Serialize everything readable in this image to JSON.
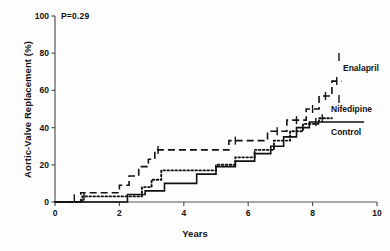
{
  "figure": {
    "annotation": "P=0.29",
    "xlabel": "Years",
    "ylabel": "Aortic-Valve Replacement (%)"
  },
  "axis": {
    "y_ticks": [
      "0",
      "20",
      "40",
      "60",
      "80",
      "100"
    ],
    "x_ticks": [
      "0",
      "2",
      "4",
      "6",
      "8",
      "10"
    ]
  },
  "legend": {
    "enalapril": "Enalapril",
    "nifedipine": "Nifedipine",
    "control": "Control"
  },
  "chart_data": {
    "type": "line",
    "subtype": "kaplan-meier-step",
    "title": "",
    "xlabel": "Years",
    "ylabel": "Aortic-Valve Replacement (%)",
    "xlim": [
      0,
      10
    ],
    "ylim": [
      0,
      100
    ],
    "xticks": [
      0,
      2,
      4,
      6,
      8,
      10
    ],
    "yticks": [
      0,
      20,
      40,
      60,
      80,
      100
    ],
    "grid": false,
    "legend_position": "right-inline",
    "annotations": [
      {
        "text": "P=0.29",
        "x": 0.25,
        "y": 96
      }
    ],
    "series": [
      {
        "name": "Enalapril",
        "style": "dashed",
        "color": "#111111",
        "final_value": 65,
        "points": [
          [
            0.0,
            0
          ],
          [
            0.8,
            0
          ],
          [
            0.8,
            5
          ],
          [
            2.0,
            5
          ],
          [
            2.0,
            9
          ],
          [
            2.3,
            9
          ],
          [
            2.3,
            14
          ],
          [
            2.6,
            14
          ],
          [
            2.6,
            19
          ],
          [
            2.9,
            19
          ],
          [
            2.9,
            23
          ],
          [
            3.1,
            23
          ],
          [
            3.1,
            28
          ],
          [
            5.4,
            28
          ],
          [
            5.4,
            33
          ],
          [
            6.6,
            33
          ],
          [
            6.6,
            38
          ],
          [
            7.2,
            38
          ],
          [
            7.2,
            44
          ],
          [
            7.8,
            44
          ],
          [
            7.8,
            50
          ],
          [
            8.2,
            50
          ],
          [
            8.2,
            57
          ],
          [
            8.6,
            57
          ],
          [
            8.6,
            65
          ],
          [
            8.9,
            65
          ]
        ],
        "censor_marks": [
          [
            0.6,
            2
          ],
          [
            3.2,
            28
          ],
          [
            5.6,
            33
          ],
          [
            6.9,
            38
          ],
          [
            7.5,
            44
          ],
          [
            8.0,
            50
          ],
          [
            8.4,
            57
          ],
          [
            8.75,
            65
          ]
        ]
      },
      {
        "name": "Nifedipine",
        "style": "dotted",
        "color": "#111111",
        "final_value": 45,
        "points": [
          [
            0.0,
            0
          ],
          [
            0.85,
            0
          ],
          [
            0.85,
            3
          ],
          [
            2.7,
            3
          ],
          [
            2.7,
            8
          ],
          [
            3.0,
            8
          ],
          [
            3.0,
            12
          ],
          [
            3.3,
            12
          ],
          [
            3.3,
            17
          ],
          [
            5.0,
            17
          ],
          [
            5.0,
            20
          ],
          [
            5.6,
            20
          ],
          [
            5.6,
            24
          ],
          [
            6.2,
            24
          ],
          [
            6.2,
            28
          ],
          [
            6.8,
            28
          ],
          [
            6.8,
            33
          ],
          [
            7.3,
            33
          ],
          [
            7.3,
            38
          ],
          [
            7.7,
            38
          ],
          [
            7.7,
            42
          ],
          [
            8.2,
            42
          ],
          [
            8.2,
            45
          ],
          [
            8.6,
            45
          ]
        ],
        "censor_marks": [
          [
            0.9,
            3
          ],
          [
            8.3,
            45
          ]
        ]
      },
      {
        "name": "Control",
        "style": "solid",
        "color": "#111111",
        "final_value": 43,
        "points": [
          [
            0.0,
            0
          ],
          [
            2.25,
            0
          ],
          [
            2.25,
            4
          ],
          [
            2.8,
            4
          ],
          [
            2.8,
            6
          ],
          [
            3.4,
            6
          ],
          [
            3.4,
            10
          ],
          [
            4.4,
            10
          ],
          [
            4.4,
            15
          ],
          [
            5.0,
            15
          ],
          [
            5.0,
            19
          ],
          [
            5.6,
            19
          ],
          [
            5.6,
            22
          ],
          [
            6.2,
            22
          ],
          [
            6.2,
            26
          ],
          [
            6.7,
            26
          ],
          [
            6.7,
            30
          ],
          [
            7.1,
            30
          ],
          [
            7.1,
            35
          ],
          [
            7.5,
            35
          ],
          [
            7.5,
            40
          ],
          [
            7.9,
            40
          ],
          [
            7.9,
            43
          ],
          [
            9.6,
            43
          ]
        ],
        "censor_marks": [
          [
            8.1,
            43
          ]
        ]
      }
    ]
  }
}
